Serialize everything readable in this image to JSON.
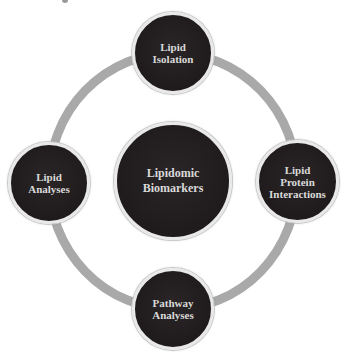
{
  "diagram": {
    "type": "cycle",
    "colors": {
      "ring": "#a9a9a9",
      "node_fill": "#1f1b1c",
      "node_border": "#e9e9e9",
      "text": "#d9d9d9",
      "background": "#ffffff"
    },
    "center": {
      "label": "Lipidomic\nBiomarkers"
    },
    "nodes": [
      {
        "id": "top",
        "label": "Lipid\nIsolation"
      },
      {
        "id": "right",
        "label": "Lipid\nProtein\nInteractions"
      },
      {
        "id": "bottom",
        "label": "Pathway\nAnalyses"
      },
      {
        "id": "left",
        "label": "Lipid\nAnalyses"
      }
    ]
  }
}
